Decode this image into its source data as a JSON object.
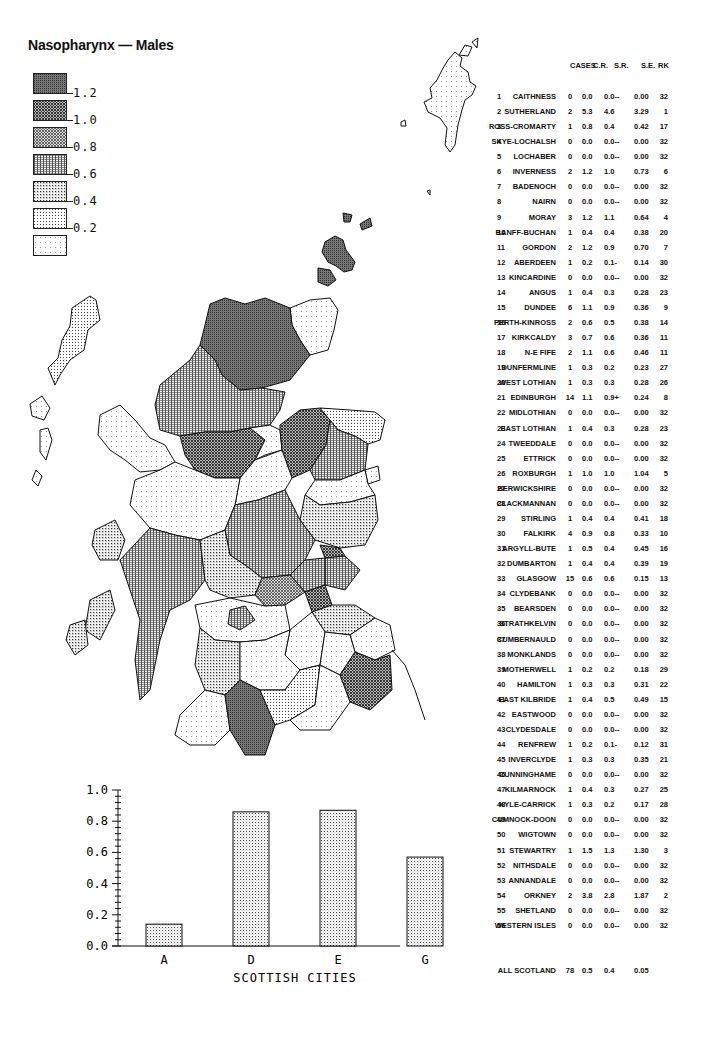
{
  "title": "Nasopharynx — Males",
  "legend": {
    "items": [
      {
        "label": "1.2",
        "pattern": "p6"
      },
      {
        "label": "1.0",
        "pattern": "p5"
      },
      {
        "label": "0.8",
        "pattern": "p4"
      },
      {
        "label": "0.6",
        "pattern": "p3"
      },
      {
        "label": "0.4",
        "pattern": "p2"
      },
      {
        "label": "0.2",
        "pattern": "p1"
      },
      {
        "label": "",
        "pattern": "p0"
      }
    ]
  },
  "table": {
    "headers": {
      "cases": "CASES",
      "cr": "C.R.",
      "sr": "S.R.",
      "se": "S.E.",
      "rk": "RK"
    },
    "rows": [
      {
        "n": "1",
        "name": "CAITHNESS",
        "cases": "0",
        "cr": "0.0",
        "sr": "0.0--",
        "se": "0.00",
        "rk": "32"
      },
      {
        "n": "2",
        "name": "SUTHERLAND",
        "cases": "2",
        "cr": "5.3",
        "sr": "4.6",
        "se": "3.29",
        "rk": "1"
      },
      {
        "n": "3",
        "name": "ROSS-CROMARTY",
        "cases": "1",
        "cr": "0.8",
        "sr": "0.4",
        "se": "0.42",
        "rk": "17"
      },
      {
        "n": "4",
        "name": "SKYE-LOCHALSH",
        "cases": "0",
        "cr": "0.0",
        "sr": "0.0--",
        "se": "0.00",
        "rk": "32"
      },
      {
        "n": "5",
        "name": "LOCHABER",
        "cases": "0",
        "cr": "0.0",
        "sr": "0.0--",
        "se": "0.00",
        "rk": "32"
      },
      {
        "n": "6",
        "name": "INVERNESS",
        "cases": "2",
        "cr": "1.2",
        "sr": "1.0",
        "se": "0.73",
        "rk": "6"
      },
      {
        "n": "7",
        "name": "BADENOCH",
        "cases": "0",
        "cr": "0.0",
        "sr": "0.0--",
        "se": "0.00",
        "rk": "32"
      },
      {
        "n": "8",
        "name": "NAIRN",
        "cases": "0",
        "cr": "0.0",
        "sr": "0.0--",
        "se": "0.00",
        "rk": "32"
      },
      {
        "n": "9",
        "name": "MORAY",
        "cases": "3",
        "cr": "1.2",
        "sr": "1.1",
        "se": "0.64",
        "rk": "4"
      },
      {
        "n": "10",
        "name": "BANFF-BUCHAN",
        "cases": "1",
        "cr": "0.4",
        "sr": "0.4",
        "se": "0.38",
        "rk": "20"
      },
      {
        "n": "11",
        "name": "GORDON",
        "cases": "2",
        "cr": "1.2",
        "sr": "0.9",
        "se": "0.70",
        "rk": "7"
      },
      {
        "n": "12",
        "name": "ABERDEEN",
        "cases": "1",
        "cr": "0.2",
        "sr": "0.1-",
        "se": "0.14",
        "rk": "30"
      },
      {
        "n": "13",
        "name": "KINCARDINE",
        "cases": "0",
        "cr": "0.0",
        "sr": "0.0--",
        "se": "0.00",
        "rk": "32"
      },
      {
        "n": "14",
        "name": "ANGUS",
        "cases": "1",
        "cr": "0.4",
        "sr": "0.3",
        "se": "0.28",
        "rk": "23"
      },
      {
        "n": "15",
        "name": "DUNDEE",
        "cases": "6",
        "cr": "1.1",
        "sr": "0.9",
        "se": "0.36",
        "rk": "9"
      },
      {
        "n": "16",
        "name": "PERTH-KINROSS",
        "cases": "2",
        "cr": "0.6",
        "sr": "0.5",
        "se": "0.38",
        "rk": "14"
      },
      {
        "n": "17",
        "name": "KIRKCALDY",
        "cases": "3",
        "cr": "0.7",
        "sr": "0.6",
        "se": "0.36",
        "rk": "11"
      },
      {
        "n": "18",
        "name": "N-E FIFE",
        "cases": "2",
        "cr": "1.1",
        "sr": "0.6",
        "se": "0.46",
        "rk": "11"
      },
      {
        "n": "19",
        "name": "DUNFERMLINE",
        "cases": "1",
        "cr": "0.3",
        "sr": "0.2",
        "se": "0.23",
        "rk": "27"
      },
      {
        "n": "20",
        "name": "WEST LOTHIAN",
        "cases": "1",
        "cr": "0.3",
        "sr": "0.3",
        "se": "0.28",
        "rk": "26"
      },
      {
        "n": "21",
        "name": "EDINBURGH",
        "cases": "14",
        "cr": "1.1",
        "sr": "0.9+",
        "se": "0.24",
        "rk": "8"
      },
      {
        "n": "22",
        "name": "MIDLOTHIAN",
        "cases": "0",
        "cr": "0.0",
        "sr": "0.0--",
        "se": "0.00",
        "rk": "32"
      },
      {
        "n": "23",
        "name": "EAST LOTHIAN",
        "cases": "1",
        "cr": "0.4",
        "sr": "0.3",
        "se": "0.28",
        "rk": "23"
      },
      {
        "n": "24",
        "name": "TWEEDDALE",
        "cases": "0",
        "cr": "0.0",
        "sr": "0.0--",
        "se": "0.00",
        "rk": "32"
      },
      {
        "n": "25",
        "name": "ETTRICK",
        "cases": "0",
        "cr": "0.0",
        "sr": "0.0--",
        "se": "0.00",
        "rk": "32"
      },
      {
        "n": "26",
        "name": "ROXBURGH",
        "cases": "1",
        "cr": "1.0",
        "sr": "1.0",
        "se": "1.04",
        "rk": "5"
      },
      {
        "n": "27",
        "name": "BERWICKSHIRE",
        "cases": "0",
        "cr": "0.0",
        "sr": "0.0--",
        "se": "0.00",
        "rk": "32"
      },
      {
        "n": "28",
        "name": "CLACKMANNAN",
        "cases": "0",
        "cr": "0.0",
        "sr": "0.0--",
        "se": "0.00",
        "rk": "32"
      },
      {
        "n": "29",
        "name": "STIRLING",
        "cases": "1",
        "cr": "0.4",
        "sr": "0.4",
        "se": "0.41",
        "rk": "18"
      },
      {
        "n": "30",
        "name": "FALKIRK",
        "cases": "4",
        "cr": "0.9",
        "sr": "0.8",
        "se": "0.33",
        "rk": "10"
      },
      {
        "n": "31",
        "name": "ARGYLL-BUTE",
        "cases": "1",
        "cr": "0.5",
        "sr": "0.4",
        "se": "0.45",
        "rk": "16"
      },
      {
        "n": "32",
        "name": "DUMBARTON",
        "cases": "1",
        "cr": "0.4",
        "sr": "0.4",
        "se": "0.39",
        "rk": "19"
      },
      {
        "n": "33",
        "name": "GLASGOW",
        "cases": "15",
        "cr": "0.6",
        "sr": "0.6",
        "se": "0.15",
        "rk": "13"
      },
      {
        "n": "34",
        "name": "CLYDEBANK",
        "cases": "0",
        "cr": "0.0",
        "sr": "0.0--",
        "se": "0.00",
        "rk": "32"
      },
      {
        "n": "35",
        "name": "BEARSDEN",
        "cases": "0",
        "cr": "0.0",
        "sr": "0.0--",
        "se": "0.00",
        "rk": "32"
      },
      {
        "n": "36",
        "name": "STRATHKELVIN",
        "cases": "0",
        "cr": "0.0",
        "sr": "0.0--",
        "se": "0.00",
        "rk": "32"
      },
      {
        "n": "37",
        "name": "CUMBERNAULD",
        "cases": "0",
        "cr": "0.0",
        "sr": "0.0--",
        "se": "0.00",
        "rk": "32"
      },
      {
        "n": "38",
        "name": "MONKLANDS",
        "cases": "0",
        "cr": "0.0",
        "sr": "0.0--",
        "se": "0.00",
        "rk": "32"
      },
      {
        "n": "39",
        "name": "MOTHERWELL",
        "cases": "1",
        "cr": "0.2",
        "sr": "0.2",
        "se": "0.18",
        "rk": "29"
      },
      {
        "n": "40",
        "name": "HAMILTON",
        "cases": "1",
        "cr": "0.3",
        "sr": "0.3",
        "se": "0.31",
        "rk": "22"
      },
      {
        "n": "41",
        "name": "EAST KILBRIDE",
        "cases": "1",
        "cr": "0.4",
        "sr": "0.5",
        "se": "0.49",
        "rk": "15"
      },
      {
        "n": "42",
        "name": "EASTWOOD",
        "cases": "0",
        "cr": "0.0",
        "sr": "0.0--",
        "se": "0.00",
        "rk": "32"
      },
      {
        "n": "43",
        "name": "CLYDESDALE",
        "cases": "0",
        "cr": "0.0",
        "sr": "0.0--",
        "se": "0.00",
        "rk": "32"
      },
      {
        "n": "44",
        "name": "RENFREW",
        "cases": "1",
        "cr": "0.2",
        "sr": "0.1-",
        "se": "0.12",
        "rk": "31"
      },
      {
        "n": "45",
        "name": "INVERCLYDE",
        "cases": "1",
        "cr": "0.3",
        "sr": "0.3",
        "se": "0.35",
        "rk": "21"
      },
      {
        "n": "46",
        "name": "CUNNINGHAME",
        "cases": "0",
        "cr": "0.0",
        "sr": "0.0--",
        "se": "0.00",
        "rk": "32"
      },
      {
        "n": "47",
        "name": "KILMARNOCK",
        "cases": "1",
        "cr": "0.4",
        "sr": "0.3",
        "se": "0.27",
        "rk": "25"
      },
      {
        "n": "48",
        "name": "KYLE-CARRICK",
        "cases": "1",
        "cr": "0.3",
        "sr": "0.2",
        "se": "0.17",
        "rk": "28"
      },
      {
        "n": "49",
        "name": "CUMNOCK-DOON",
        "cases": "0",
        "cr": "0.0",
        "sr": "0.0--",
        "se": "0.00",
        "rk": "32"
      },
      {
        "n": "50",
        "name": "WIGTOWN",
        "cases": "0",
        "cr": "0.0",
        "sr": "0.0--",
        "se": "0.00",
        "rk": "32"
      },
      {
        "n": "51",
        "name": "STEWARTRY",
        "cases": "1",
        "cr": "1.5",
        "sr": "1.3",
        "se": "1.30",
        "rk": "3"
      },
      {
        "n": "52",
        "name": "NITHSDALE",
        "cases": "0",
        "cr": "0.0",
        "sr": "0.0--",
        "se": "0.00",
        "rk": "32"
      },
      {
        "n": "53",
        "name": "ANNANDALE",
        "cases": "0",
        "cr": "0.0",
        "sr": "0.0--",
        "se": "0.00",
        "rk": "32"
      },
      {
        "n": "54",
        "name": "ORKNEY",
        "cases": "2",
        "cr": "3.8",
        "sr": "2.8",
        "se": "1.87",
        "rk": "2"
      },
      {
        "n": "55",
        "name": "SHETLAND",
        "cases": "0",
        "cr": "0.0",
        "sr": "0.0--",
        "se": "0.00",
        "rk": "32"
      },
      {
        "n": "56",
        "name": "WESTERN ISLES",
        "cases": "0",
        "cr": "0.0",
        "sr": "0.0--",
        "se": "0.00",
        "rk": "32"
      }
    ],
    "total": {
      "name": "ALL SCOTLAND",
      "cases": "78",
      "cr": "0.5",
      "sr": "0.4",
      "se": "0.05"
    }
  },
  "chart_data": [
    {
      "type": "bar",
      "title": "",
      "xlabel": "SCOTTISH CITIES",
      "ylabel": "",
      "categories": [
        "A",
        "D",
        "E",
        "G"
      ],
      "values": [
        0.14,
        0.86,
        0.87,
        0.57
      ],
      "ylim": [
        0,
        1.0
      ],
      "yticks": [
        "0.0",
        "0.2",
        "0.4",
        "0.6",
        "0.8",
        "1.0"
      ],
      "grid": false
    },
    {
      "type": "table",
      "title": "Nasopharynx — Males",
      "columns": [
        "#",
        "District",
        "CASES",
        "C.R.",
        "S.R.",
        "S.E.",
        "RK"
      ],
      "note": "see table.rows for district values; map choropleth shaded by S.R. with legend breaks 0.2, 0.4, 0.6, 0.8, 1.0, 1.2"
    }
  ]
}
